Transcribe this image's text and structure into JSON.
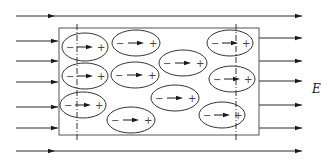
{
  "diagram": {
    "field_label": "E",
    "field_direction": "right",
    "colors": {
      "line": "#2a2a2a",
      "box": "#555555",
      "background": "#ffffff"
    },
    "field_lines": {
      "full_span": 2,
      "left_incoming": 5,
      "right_outgoing": 5
    },
    "dielectric_slab": {
      "label": "dielectric slab",
      "boundary_markers": "dash-dot vertical lines near each face"
    },
    "molecules": [
      {
        "id": 1,
        "negative": "−",
        "positive": "+",
        "dipole": "arrow-right"
      },
      {
        "id": 2,
        "negative": "−",
        "positive": "+",
        "dipole": "arrow-right"
      },
      {
        "id": 3,
        "negative": "−",
        "positive": "+",
        "dipole": "arrow-right"
      },
      {
        "id": 4,
        "negative": "−",
        "positive": "+",
        "dipole": "arrow-right"
      },
      {
        "id": 5,
        "negative": "−",
        "positive": "+",
        "dipole": "arrow-right"
      },
      {
        "id": 6,
        "negative": "−",
        "positive": "+",
        "dipole": "arrow-right"
      },
      {
        "id": 7,
        "negative": "−",
        "positive": "+",
        "dipole": "arrow-right"
      },
      {
        "id": 8,
        "negative": "−",
        "positive": "+",
        "dipole": "arrow-right"
      },
      {
        "id": 9,
        "negative": "−",
        "positive": "+",
        "dipole": "arrow-right"
      },
      {
        "id": 10,
        "negative": "−",
        "positive": "+",
        "dipole": "arrow-right"
      },
      {
        "id": 11,
        "negative": "−",
        "positive": "+",
        "dipole": "arrow-right"
      }
    ]
  }
}
